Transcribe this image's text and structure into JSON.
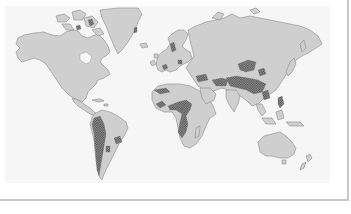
{
  "figure": {
    "type": "world-map",
    "caption": "",
    "colors": {
      "background": "#ffffff",
      "panel": "#f6f6f6",
      "land": "#cfcfcf",
      "coastline": "#8a8a8a",
      "hatched_region": "#555555",
      "frame_border": "#c8c8c8"
    },
    "legend": [],
    "regions": {
      "continents": [
        "North America",
        "Greenland",
        "South America",
        "Europe",
        "Africa",
        "Asia",
        "Australia",
        "New Zealand",
        "Madagascar",
        "Japan",
        "Southeast Asia islands"
      ],
      "hatched_areas": [
        "Andes (western South America)",
        "Eastern Brazil highlands",
        "Atlas / northern Sahara",
        "Central Sahara / Sahel",
        "East African highlands",
        "Southern Africa",
        "Anatolia / Caucasus",
        "Iranian plateau",
        "Himalaya / Tibetan plateau",
        "Central Asian mountains (Tian Shan / Altai)",
        "Southern China",
        "Philippines",
        "Arctic Canadian islands"
      ]
    }
  }
}
